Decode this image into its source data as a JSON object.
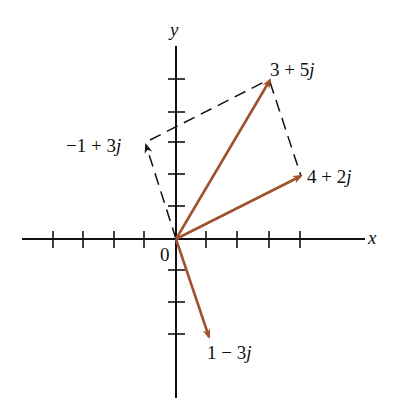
{
  "diagram": {
    "axes": {
      "x_label": "x",
      "y_label": "y",
      "origin_label": "0",
      "x_ticks": [
        -4,
        -3,
        -2,
        -1,
        1,
        2,
        3,
        4
      ],
      "y_ticks": [
        -3,
        -2,
        -1,
        1,
        2,
        3,
        4,
        5
      ]
    },
    "colors": {
      "vector": "#a0522d",
      "axis": "#111111",
      "dashed": "#111111"
    },
    "vectors": [
      {
        "label": "3 + 5j",
        "re": 3,
        "im": 5,
        "style": "solid"
      },
      {
        "label": "4 + 2j",
        "re": 4,
        "im": 2,
        "style": "solid"
      },
      {
        "label": "1 − 3j",
        "re": 1,
        "im": -3,
        "style": "solid"
      },
      {
        "label": "−1 + 3j",
        "re": -1,
        "im": 3,
        "style": "dashed"
      }
    ],
    "labels": {
      "v1_num": "3 + 5",
      "v1_j": "j",
      "v2_num": "4 + 2",
      "v2_j": "j",
      "v3_num": "1 − 3",
      "v3_j": "j",
      "v4_num": "−1 + 3",
      "v4_j": "j"
    }
  }
}
